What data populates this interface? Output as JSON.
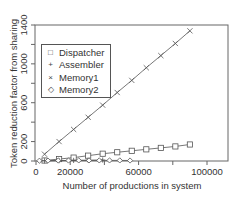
{
  "chart_data": {
    "type": "line",
    "title": "",
    "xlabel": "Number of productions in system",
    "ylabel": "Token reduction factor from sharing",
    "xlim": [
      0,
      115000
    ],
    "ylim": [
      0,
      1400
    ],
    "x_ticks": [
      0,
      20000,
      40000,
      60000,
      80000,
      100000,
      120000
    ],
    "x_tick_labels": [
      "0",
      "20000",
      "",
      "60000",
      "",
      "100000",
      ""
    ],
    "y_ticks": [
      0,
      200,
      400,
      600,
      800,
      1000,
      1200,
      1400
    ],
    "y_tick_labels": [
      "0",
      "200",
      "",
      "600",
      "",
      "1000",
      "",
      "1400"
    ],
    "grid": false,
    "legend_position": "upper left",
    "series": [
      {
        "name": "Dispatcher",
        "marker": "square",
        "x": [
          5000,
          13500,
          22000,
          30500,
          39000,
          47500,
          56000,
          64500,
          73000,
          81500,
          90000
        ],
        "y": [
          5,
          20,
          35,
          55,
          75,
          90,
          105,
          120,
          135,
          150,
          170
        ]
      },
      {
        "name": "Assembler",
        "marker": "plus",
        "x": [
          5000,
          13500,
          22000,
          30500,
          39000
        ],
        "y": [
          2,
          4,
          6,
          8,
          10
        ]
      },
      {
        "name": "Memory1",
        "marker": "x",
        "x": [
          5000,
          13500,
          22000,
          30500,
          39000,
          47500,
          56000,
          64500,
          73000,
          81500,
          90000
        ],
        "y": [
          70,
          200,
          325,
          450,
          575,
          705,
          830,
          960,
          1085,
          1210,
          1340
        ]
      },
      {
        "name": "Memory2",
        "marker": "diamond",
        "x": [
          2000,
          7000,
          13000,
          19000,
          25000,
          31000,
          37000,
          43000,
          49000,
          55000
        ],
        "y": [
          3,
          4,
          5,
          5,
          6,
          6,
          6,
          6,
          6,
          5
        ]
      }
    ]
  },
  "labels": {
    "xlabel": "Number of productions in system",
    "ylabel": "Token reduction factor from sharing"
  },
  "legend": [
    {
      "symbol": "□",
      "label": "Dispatcher"
    },
    {
      "symbol": "+",
      "label": "Assembler"
    },
    {
      "symbol": "×",
      "label": "Memory1"
    },
    {
      "symbol": "◇",
      "label": "Memory2"
    }
  ]
}
